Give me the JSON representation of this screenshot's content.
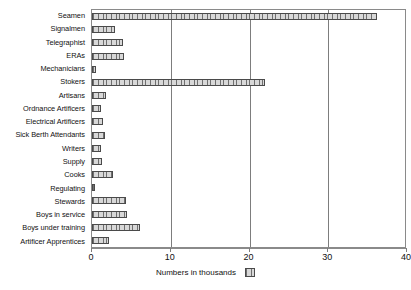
{
  "chart_data": {
    "type": "bar",
    "orientation": "horizontal",
    "title": "",
    "subtitle": "",
    "xlabel": "Numbers in thousands",
    "ylabel": "",
    "xlim": [
      0,
      40
    ],
    "xticks": [
      0,
      10,
      20,
      30,
      40
    ],
    "xtick_labels": [
      "0",
      "10",
      "20",
      "30",
      "40"
    ],
    "grid": true,
    "grid_axis": "x",
    "legend": {
      "position": "bottom-center",
      "entries": [
        {
          "label": "Numbers in thousands",
          "swatch": "hatched-grey"
        }
      ]
    },
    "categories": [
      "Seamen",
      "Signalmen",
      "Telegraphist",
      "ERAs",
      "Mechanicians",
      "Stokers",
      "Artisans",
      "Ordnance Artificers",
      "Electrical Artificers",
      "Sick Berth Attendants",
      "Writers",
      "Supply",
      "Cooks",
      "Regulating",
      "Stewards",
      "Boys in service",
      "Boys under training",
      "Artificer Apprentices"
    ],
    "values": [
      36.2,
      2.9,
      3.9,
      4.0,
      0.5,
      22.0,
      1.8,
      1.1,
      1.4,
      1.6,
      1.1,
      1.3,
      2.7,
      0.4,
      4.3,
      4.4,
      6.1,
      2.1
    ]
  },
  "colors": {
    "bar_fill": "#c9c9c9",
    "bar_hatch": "#6f6f6f",
    "bar_border": "#4a4a4a",
    "gridline": "#7d7d7d",
    "frame": "#8a8a8a",
    "text": "#111111",
    "background": "#ffffff"
  }
}
